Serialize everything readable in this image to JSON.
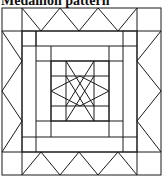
{
  "title": "Medallion pattern",
  "diagram": {
    "type": "quilt-block",
    "colors": {
      "line": "#1a1a1a",
      "background": "#ffffff"
    }
  }
}
